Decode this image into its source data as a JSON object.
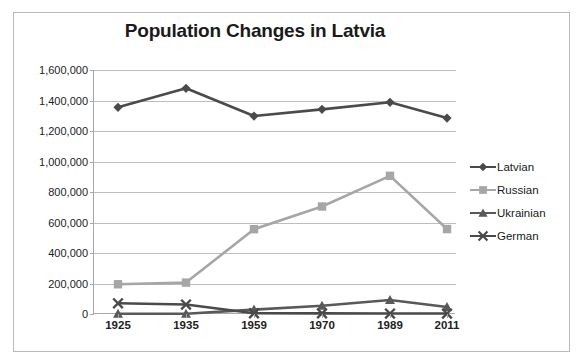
{
  "chart_data": {
    "type": "line",
    "title": "Population Changes in Latvia",
    "xlabel": "",
    "ylabel": "",
    "categories": [
      "1925",
      "1935",
      "1959",
      "1970",
      "1989",
      "2011"
    ],
    "ylim": [
      0,
      1600000
    ],
    "ytick_labels": [
      "1,600,000",
      "1,400,000",
      "1,200,000",
      "1,000,000",
      "800,000",
      "600,000",
      "400,000",
      "200,000",
      "0"
    ],
    "ytick_values": [
      1600000,
      1400000,
      1200000,
      1000000,
      800000,
      600000,
      400000,
      200000,
      0
    ],
    "grid": true,
    "legend_position": "right",
    "series": [
      {
        "name": "Latvian",
        "marker": "diamond",
        "color": "#4a4a4a",
        "values": [
          1355000,
          1480000,
          1298000,
          1342000,
          1388000,
          1285000
        ]
      },
      {
        "name": "Russian",
        "marker": "square",
        "color": "#a6a6a6",
        "values": [
          195000,
          206000,
          556000,
          705000,
          906000,
          557000
        ]
      },
      {
        "name": "Ukrainian",
        "marker": "triangle",
        "color": "#595959",
        "values": [
          2000,
          2000,
          29000,
          54000,
          92000,
          46000
        ]
      },
      {
        "name": "German",
        "marker": "cross",
        "color": "#4a4a4a",
        "values": [
          70000,
          62000,
          5000,
          4000,
          3000,
          3000
        ]
      }
    ]
  },
  "colors": {
    "title": "#1a1a1a",
    "gridline": "#bdbdbd",
    "axis": "#a8a8a8",
    "frame": "#b9b9b9",
    "background": "#ffffff"
  }
}
